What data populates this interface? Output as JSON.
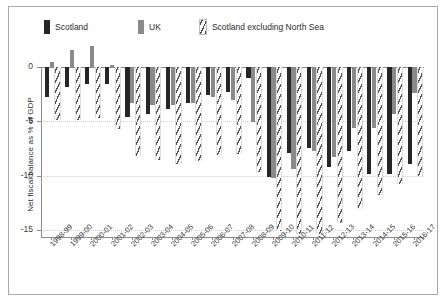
{
  "chart_data": {
    "type": "bar",
    "title": "",
    "xlabel": "",
    "ylabel": "Net fiscal balance as % of GDP",
    "ylim": [
      -17,
      2
    ],
    "yticks": [
      0,
      -5,
      -10,
      -15
    ],
    "ytick_labels": [
      "0",
      "-5",
      "-10",
      "-15"
    ],
    "grid": true,
    "legend_position": "top-left",
    "categories": [
      "1998-99",
      "1999-00",
      "2000-01",
      "2001-02",
      "2002-03",
      "2003-04",
      "2004-05",
      "2005-06",
      "2006-07",
      "2007-08",
      "2008-09",
      "2009-10",
      "2010-11",
      "2011-12",
      "2012-13",
      "2013-14",
      "2014-15",
      "2015-16",
      "2016-17"
    ],
    "series": [
      {
        "name": "Scotland",
        "color": "#262626",
        "pattern": "solid",
        "values": [
          -2.8,
          -1.8,
          -1.6,
          -1.6,
          -4.6,
          -4.3,
          -3.9,
          -3.3,
          -2.6,
          -2.3,
          -1.0,
          -10.1,
          -7.9,
          -7.5,
          -9.2,
          -7.7,
          -9.9,
          -9.9,
          -8.9
        ]
      },
      {
        "name": "UK",
        "color": "#8a8a8a",
        "pattern": "solid",
        "values": [
          0.5,
          1.6,
          1.9,
          0.2,
          -3.3,
          -3.5,
          -3.5,
          -3.3,
          -2.8,
          -3.0,
          -5.1,
          -10.2,
          -9.4,
          -7.7,
          -8.3,
          -5.6,
          -5.6,
          -4.3,
          -2.4
        ]
      },
      {
        "name": "Scotland excluding North Sea",
        "color": "#555555",
        "pattern": "hatched",
        "values": [
          -4.9,
          -4.9,
          -4.7,
          -5.7,
          -8.2,
          -8.6,
          -8.9,
          -8.7,
          -8.1,
          -8.0,
          -9.7,
          -15.1,
          -15.4,
          -15.4,
          -14.4,
          -13.1,
          -11.8,
          -10.8,
          -10.0
        ]
      }
    ]
  },
  "legend": {
    "items": [
      {
        "label": "Scotland",
        "swatch": "solid-dark"
      },
      {
        "label": "UK",
        "swatch": "solid-gray"
      },
      {
        "label": "Scotland excluding North Sea",
        "swatch": "hatched"
      }
    ]
  },
  "axis": {
    "y_title": "Net fiscal balance as % of GDP"
  }
}
